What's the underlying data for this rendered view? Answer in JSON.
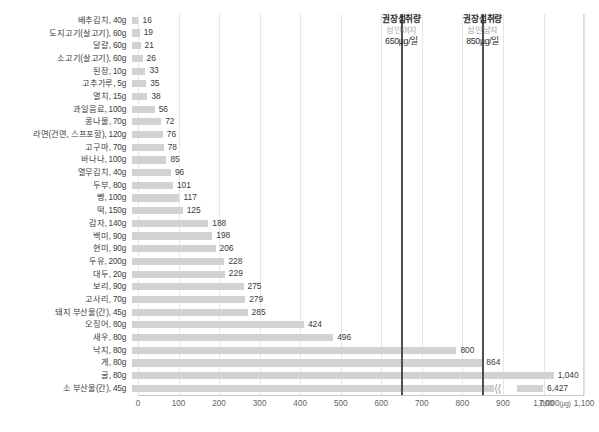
{
  "chart_data": {
    "type": "bar",
    "orientation": "horizontal",
    "title": "",
    "xlabel": "",
    "ylabel": "",
    "unit": "µg",
    "xlim": [
      0,
      1150
    ],
    "grid": true,
    "axis_break": {
      "enabled": true,
      "after_value": 1100,
      "resume_label": "7,000"
    },
    "categories": [
      "배추김치, 40g",
      "도지고기(살고기), 60g",
      "달걀, 60g",
      "소고기(살고기), 60g",
      "된장, 10g",
      "고추가루, 5g",
      "멸치, 15g",
      "과일음료, 100g",
      "콩나물, 70g",
      "라면(건면, 스프포함), 120g",
      "고구마, 70g",
      "바나나, 100g",
      "열무김치, 40g",
      "두부, 80g",
      "빵, 100g",
      "떡, 150g",
      "감자, 140g",
      "백미, 90g",
      "현미, 90g",
      "두유, 200g",
      "대두, 20g",
      "보리, 90g",
      "고사리, 70g",
      "돼지 부산물(간), 45g",
      "오징어, 80g",
      "새우, 80g",
      "낙지, 80g",
      "게, 80g",
      "굴, 80g",
      "소 부산물(간), 45g"
    ],
    "values": [
      16,
      19,
      21,
      26,
      33,
      35,
      38,
      56,
      72,
      76,
      78,
      85,
      96,
      101,
      117,
      125,
      188,
      198,
      206,
      228,
      229,
      275,
      279,
      285,
      424,
      496,
      800,
      864,
      1040,
      6427
    ],
    "value_labels": [
      "16",
      "19",
      "21",
      "26",
      "33",
      "35",
      "38",
      "56",
      "72",
      "76",
      "78",
      "85",
      "96",
      "101",
      "117",
      "125",
      "188",
      "198",
      "206",
      "228",
      "229",
      "275",
      "279",
      "285",
      "424",
      "496",
      "800",
      "864",
      "1,040",
      "6,427"
    ],
    "xticks": [
      0,
      100,
      200,
      300,
      400,
      500,
      600,
      700,
      800,
      900,
      1000,
      1100
    ],
    "xtick_labels": [
      "0",
      "100",
      "200",
      "300",
      "400",
      "500",
      "600",
      "700",
      "800",
      "900",
      "1,000",
      "1,100"
    ],
    "xtick_last_label": "7,000",
    "xtick_last_unit": "(µg)",
    "reference_lines": [
      {
        "value": 650,
        "title": "권장섭취량",
        "subtitle": "성인여자",
        "amount": "650µg/일",
        "color": "#4f4f4f"
      },
      {
        "value": 850,
        "title": "권장섭취량",
        "subtitle": "성인남자",
        "amount": "850µg/일",
        "color": "#4f4f4f"
      }
    ],
    "colors": {
      "bar": "#d2d2d2",
      "gridline": "#e6e6e6",
      "axis": "#c9c9c9",
      "reference_line": "#4f4f4f",
      "text": "#3b3b3b",
      "subtitle_text": "#a9a9a9"
    }
  }
}
